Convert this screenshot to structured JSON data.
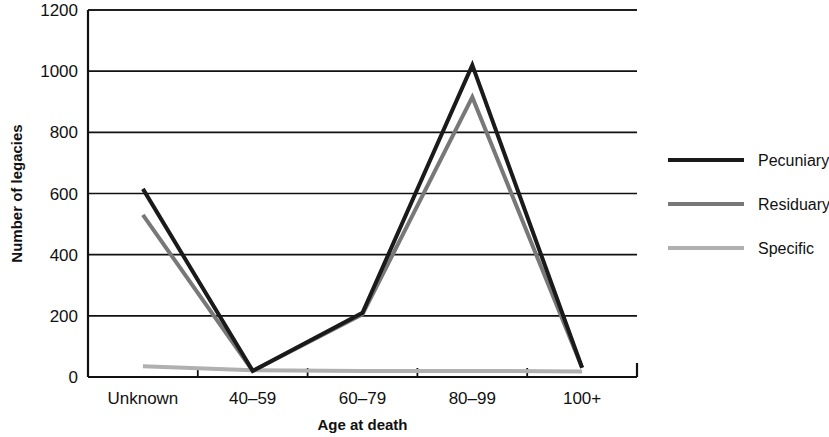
{
  "chart_data": {
    "type": "line",
    "title": "",
    "subtitle": "",
    "xlabel": "Age at death",
    "ylabel": "Number of legacies",
    "categories": [
      "Unknown",
      "40–59",
      "60–79",
      "80–99",
      "100+"
    ],
    "ylim": [
      0,
      1200
    ],
    "ytick_labels": [
      "0",
      "200",
      "400",
      "600",
      "800",
      "1000",
      "1200"
    ],
    "ytick_values": [
      0,
      200,
      400,
      600,
      800,
      1000,
      1200
    ],
    "grid": true,
    "grid_axis": "y",
    "legend_position": "right",
    "series": [
      {
        "name": "Pecuniary",
        "color": "#1a1a1a",
        "line_width": 4,
        "values": [
          615,
          20,
          210,
          1020,
          30
        ]
      },
      {
        "name": "Residuary",
        "color": "#787878",
        "line_width": 4,
        "values": [
          530,
          20,
          205,
          915,
          30
        ]
      },
      {
        "name": "Specific",
        "color": "#b0b0b0",
        "line_width": 4,
        "values": [
          35,
          22,
          20,
          20,
          18
        ]
      }
    ]
  },
  "axes": {
    "y_axis_title": "Number of legacies",
    "x_axis_title": "Age at death"
  },
  "legend": {
    "entries": [
      {
        "label": "Pecuniary",
        "color": "#1a1a1a"
      },
      {
        "label": "Residuary",
        "color": "#787878"
      },
      {
        "label": "Specific",
        "color": "#b0b0b0"
      }
    ]
  }
}
